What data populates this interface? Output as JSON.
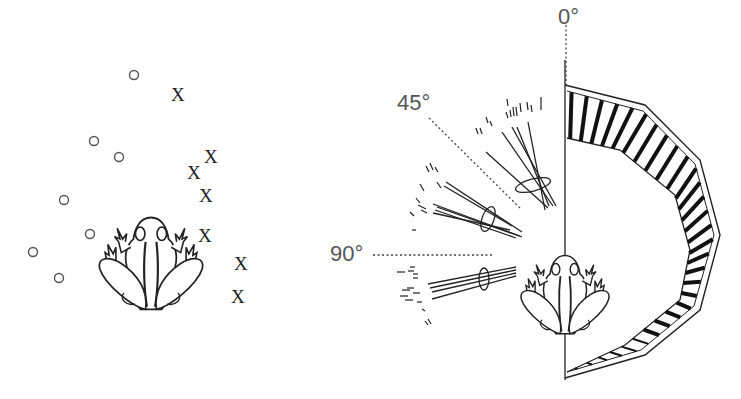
{
  "figure": {
    "left_panel": {
      "description": "Frog with prey positions: circles and X marks",
      "circles": [
        {
          "x": 134,
          "y": 75
        },
        {
          "x": 94,
          "y": 141
        },
        {
          "x": 119,
          "y": 157
        },
        {
          "x": 64,
          "y": 200
        },
        {
          "x": 90,
          "y": 234
        },
        {
          "x": 33,
          "y": 252
        },
        {
          "x": 59,
          "y": 278
        }
      ],
      "x_marks": [
        {
          "label": "X",
          "x": 178,
          "y": 95
        },
        {
          "label": "X",
          "x": 211,
          "y": 157
        },
        {
          "label": "X",
          "x": 194,
          "y": 173
        },
        {
          "label": "X",
          "x": 206,
          "y": 196
        },
        {
          "label": "X",
          "x": 205,
          "y": 236
        },
        {
          "label": "X",
          "x": 241,
          "y": 264
        },
        {
          "label": "X",
          "x": 238,
          "y": 297
        }
      ]
    },
    "right_panel": {
      "angle_labels": [
        {
          "text": "0°",
          "x": 558,
          "y": 6
        },
        {
          "text": "45°",
          "x": 397,
          "y": 92
        },
        {
          "text": "90°",
          "x": 330,
          "y": 243
        }
      ],
      "colors": {
        "ink": "#222222",
        "label": "#555555"
      }
    }
  }
}
